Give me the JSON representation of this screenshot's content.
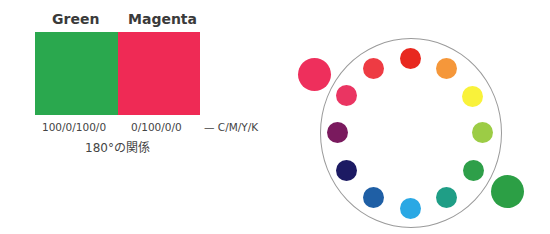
{
  "pair": {
    "left": {
      "name": "Green",
      "cmyk": "100/0/100/0",
      "color": "#2aa84e"
    },
    "right": {
      "name": "Magenta",
      "cmyk": "0/100/0/0",
      "color": "#ef2a55"
    },
    "legend": "— C/M/Y/K",
    "caption": "180°の関係"
  },
  "wheel": {
    "center": [
      411,
      133
    ],
    "radius": 91,
    "ring_color": "#9a9a9a",
    "dots": [
      {
        "name": "red",
        "color": "#e8281f",
        "x": 410,
        "y": 58
      },
      {
        "name": "orange",
        "color": "#f5973a",
        "x": 446,
        "y": 68
      },
      {
        "name": "yellow",
        "color": "#f9f23a",
        "x": 472,
        "y": 96
      },
      {
        "name": "yellow-green",
        "color": "#9ccc45",
        "x": 482,
        "y": 132
      },
      {
        "name": "green",
        "color": "#2e9f49",
        "x": 473,
        "y": 170
      },
      {
        "name": "teal",
        "color": "#1f9e86",
        "x": 446,
        "y": 197
      },
      {
        "name": "sky-blue",
        "color": "#2aa8e4",
        "x": 410,
        "y": 208
      },
      {
        "name": "blue",
        "color": "#1f5fa5",
        "x": 373,
        "y": 197
      },
      {
        "name": "navy",
        "color": "#1c1a63",
        "x": 346,
        "y": 170
      },
      {
        "name": "purple",
        "color": "#7a1a5e",
        "x": 337,
        "y": 132
      },
      {
        "name": "pink-red",
        "color": "#ea3562",
        "x": 346,
        "y": 95
      },
      {
        "name": "red-pink",
        "color": "#ee3b43",
        "x": 373,
        "y": 68
      }
    ],
    "highlight": [
      {
        "name": "magenta",
        "color": "#ee2f5c",
        "x": 314,
        "y": 74
      },
      {
        "name": "green",
        "color": "#2c9f45",
        "x": 507,
        "y": 191
      }
    ]
  }
}
